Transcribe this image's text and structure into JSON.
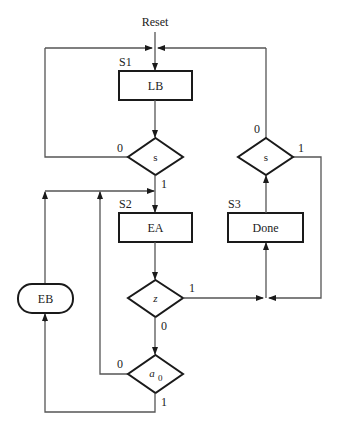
{
  "diagram": {
    "reset_label": "Reset",
    "states": [
      {
        "name": "S1",
        "action": "LB"
      },
      {
        "name": "S2",
        "action": "EA"
      },
      {
        "name": "S3",
        "action": "Done"
      }
    ],
    "conditional_output": {
      "label": "EB"
    },
    "decisions": [
      {
        "id": "s_left",
        "condition": "s",
        "branch0": "0",
        "branch1": "1"
      },
      {
        "id": "s_right",
        "condition": "s",
        "branch0": "0",
        "branch1": "1"
      },
      {
        "id": "z",
        "condition": "z",
        "branch0": "0",
        "branch1": "1"
      },
      {
        "id": "a0",
        "condition": "a",
        "condition_sub": "0",
        "branch0": "0",
        "branch1": "1"
      }
    ]
  },
  "colors": {
    "stroke": "#1a1a1a",
    "wire": "#555555",
    "background": "#ffffff"
  }
}
